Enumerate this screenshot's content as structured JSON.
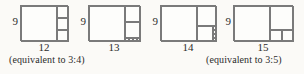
{
  "unit_px": 4,
  "line_color": "#7a7a7a",
  "text_color": "#2b2b2b",
  "background": "#fbfaf7",
  "figures": [
    {
      "height_label": "9",
      "width_label": "12",
      "w": 12,
      "h": 9,
      "decomposition": [
        9,
        3,
        3,
        3
      ]
    },
    {
      "height_label": "9",
      "width_label": "13",
      "w": 13,
      "h": 9,
      "decomposition": [
        9,
        4,
        4,
        1,
        1,
        1,
        1
      ]
    },
    {
      "height_label": "9",
      "width_label": "14",
      "w": 14,
      "h": 9,
      "decomposition": [
        9,
        5,
        4,
        1,
        1,
        1,
        1
      ]
    },
    {
      "height_label": "9",
      "width_label": "15",
      "w": 15,
      "h": 9,
      "decomposition": [
        9,
        6,
        3,
        3
      ]
    }
  ],
  "captions": [
    "(equivalent to 3:4)",
    "(equivalent to 3:5)"
  ]
}
